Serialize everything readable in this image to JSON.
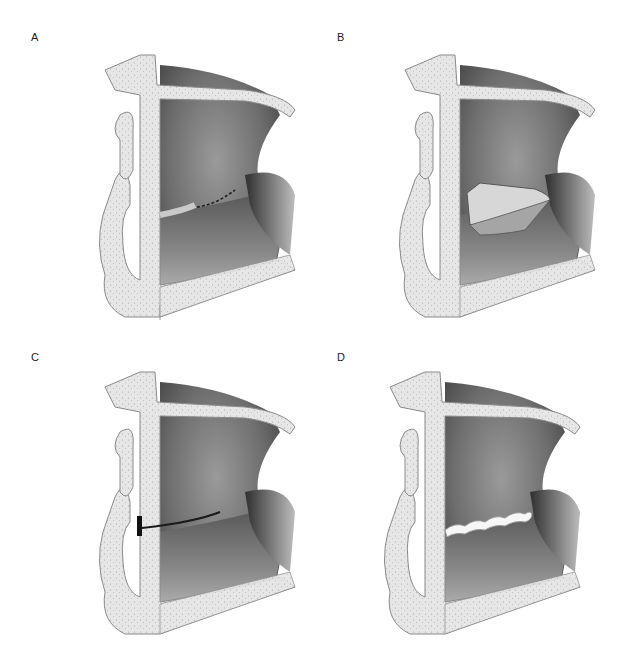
{
  "figure": {
    "panels": [
      {
        "id": "A",
        "label": "A",
        "variant": "dotted-incision"
      },
      {
        "id": "B",
        "label": "B",
        "variant": "flap-raised"
      },
      {
        "id": "C",
        "label": "C",
        "variant": "slit-opening"
      },
      {
        "id": "D",
        "label": "D",
        "variant": "implant-inserted"
      }
    ]
  }
}
